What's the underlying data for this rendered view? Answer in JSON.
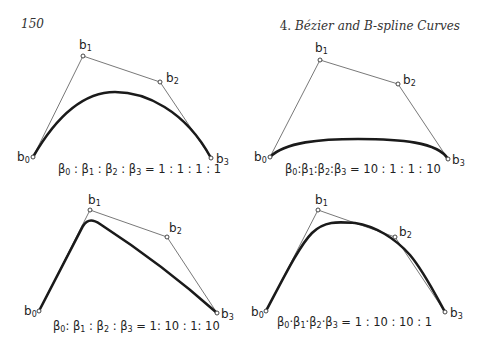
{
  "header": {
    "page_number": "150",
    "chapter_number": "4.",
    "chapter_title": "Bézier and B-spline Curves"
  },
  "panels": [
    {
      "id": "panel-1",
      "caption_lhs": "β₀ : β₁ : β₂ : β₃ = ",
      "caption_rhs": "1:1:1:1",
      "weights": [
        1,
        1,
        1,
        1
      ],
      "control_points": [
        [
          33,
          157
        ],
        [
          83,
          56
        ],
        [
          160,
          82
        ],
        [
          211,
          158
        ]
      ],
      "curve_path": "M33,157 C60,110 88,92 115,92 C145,92 185,110 211,158",
      "labels": [
        "b0",
        "b1",
        "b2",
        "b3"
      ]
    },
    {
      "id": "panel-2",
      "caption_lhs": "β₀:β₁:β₂:β₃",
      "caption_eq": "=",
      "caption_rhs": "10:1:1:10",
      "weights": [
        10,
        1,
        1,
        10
      ],
      "control_points": [
        [
          270,
          157
        ],
        [
          320,
          60
        ],
        [
          398,
          84
        ],
        [
          448,
          159
        ]
      ],
      "curve_path": "M270,157 C285,142 320,139 358,139 C400,139 438,142 448,159",
      "labels": [
        "b0",
        "b1",
        "b2",
        "b3"
      ]
    },
    {
      "id": "panel-3",
      "caption_lhs": "β₀: β₁ : β₂ : β₃",
      "caption_eq": "=",
      "caption_rhs": "1: 10 : 1: 10",
      "weights": [
        1,
        10,
        1,
        10
      ],
      "control_points": [
        [
          39,
          311
        ],
        [
          90,
          210
        ],
        [
          167,
          237
        ],
        [
          217,
          313
        ]
      ],
      "curve_path": "M39,311 L83,226 C88,218 94,220 100,224 C140,250 180,280 217,313",
      "labels": [
        "b0",
        "b1",
        "b2",
        "b3"
      ]
    },
    {
      "id": "panel-4",
      "caption_lhs": "β₀·β₁·β₂·β₃",
      "caption_eq": "=",
      "caption_rhs": "1 : 10 : 10 : 1",
      "weights": [
        1,
        10,
        10,
        1
      ],
      "control_points": [
        [
          266,
          311
        ],
        [
          318,
          210
        ],
        [
          395,
          237
        ],
        [
          445,
          312
        ]
      ],
      "curve_path": "M266,311 C285,275 300,245 312,233 C325,220 340,222 355,223 C375,226 395,238 410,255 C425,273 437,298 445,312",
      "labels": [
        "b0",
        "b1",
        "b2",
        "b3"
      ]
    }
  ]
}
